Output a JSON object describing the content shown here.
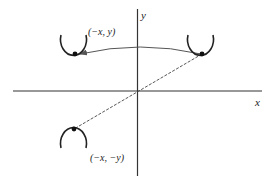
{
  "diagram": {
    "type": "coordinate-plane-reflection",
    "axes": {
      "x_label": "x",
      "y_label": "y"
    },
    "points": [
      {
        "id": "upper-left",
        "label": "(−x, y)"
      },
      {
        "id": "upper-right",
        "label": ""
      },
      {
        "id": "lower-left",
        "label": "(−x, −y)"
      }
    ],
    "connectors": [
      {
        "from": "upper-right",
        "to": "upper-left",
        "style": "solid-curved-arrow"
      },
      {
        "from": "upper-right",
        "to": "lower-left",
        "style": "dashed-through-origin"
      }
    ],
    "colors": {
      "stroke": "#222222",
      "arrow": "#555555",
      "background": "#ffffff"
    }
  }
}
